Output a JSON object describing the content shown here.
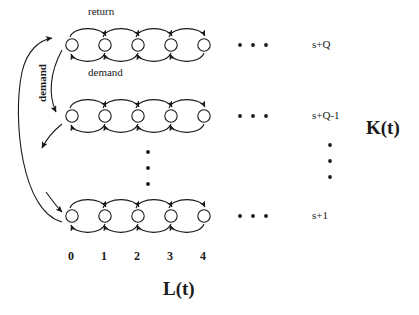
{
  "diagram": {
    "axis": {
      "horizontal_label": "L(t)",
      "vertical_label": "K(t)"
    },
    "flow_labels": {
      "return": "return",
      "demand_horizontal": "demand",
      "demand_vertical": "demand"
    },
    "column_labels": [
      "0",
      "1",
      "2",
      "3",
      "4"
    ],
    "row_labels": [
      "s+Q",
      "s+Q-1",
      "s+1"
    ],
    "horizontal_ellipsis": "• • •",
    "vertical_ellipsis_dots": 3,
    "states_per_row": 5,
    "rows_shown": 3,
    "colors": {
      "stroke": "#1a1a1a",
      "background": "#ffffff",
      "node_fill": "#ffffff"
    }
  }
}
